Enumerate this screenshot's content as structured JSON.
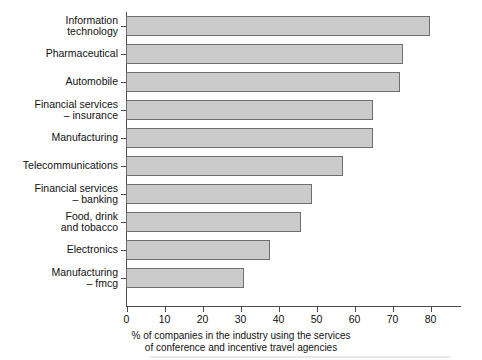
{
  "chart_data": {
    "type": "bar",
    "orientation": "horizontal",
    "title": "",
    "xlabel": "% of companies in the industry using the services of conference and incentive travel agencies",
    "ylabel": "",
    "xlim": [
      0,
      80
    ],
    "xticks": [
      0,
      10,
      20,
      30,
      40,
      50,
      60,
      70,
      80
    ],
    "grid": false,
    "legend": false,
    "categories": [
      "Information\ntechnology",
      "Pharmaceutical",
      "Automobile",
      "Financial services\n– insurance",
      "Manufacturing",
      "Telecommunications",
      "Financial services\n– banking",
      "Food, drink\nand tobacco",
      "Electronics",
      "Manufacturing\n– fmcg"
    ],
    "values": [
      80,
      73,
      72,
      65,
      65,
      57,
      49,
      46,
      38,
      31
    ],
    "bar_fill_color": "#cbcbcb",
    "bar_border_color": "#6e6e6e",
    "axis_color": "#4a4a4a"
  },
  "caption": {
    "line1": "% of companies in the industry using the services",
    "line2": "of conference and incentive travel agencies"
  },
  "xtick_labels": [
    "0",
    "10",
    "20",
    "30",
    "40",
    "50",
    "60",
    "70",
    "80"
  ]
}
